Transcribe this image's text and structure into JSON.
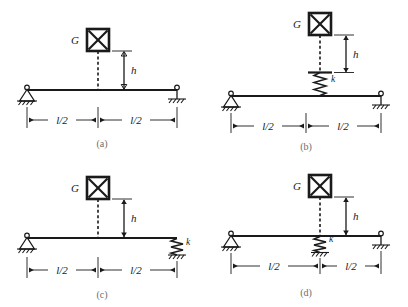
{
  "figure": {
    "background_color": "#ffffff",
    "line_color": "#1a1a1a",
    "caption_color": "#6e6e6e"
  },
  "labels": {
    "weight": "G",
    "height": "h",
    "stiffness": "k",
    "half_span": "l/2"
  },
  "panels": [
    {
      "id": "a",
      "caption": "(a)",
      "weight_label": "G",
      "height_label": "h",
      "stiffness_label": "",
      "dim_left_label": "l/2",
      "dim_right_label": "l/2",
      "left_support": "pin",
      "right_support": "roller",
      "spring_location": "none",
      "has_spring": false,
      "has_plate": false
    },
    {
      "id": "b",
      "caption": "(b)",
      "weight_label": "G",
      "height_label": "h",
      "stiffness_label": "k",
      "dim_left_label": "l/2",
      "dim_right_label": "l/2",
      "left_support": "pin",
      "right_support": "roller",
      "spring_location": "midspan-above-beam",
      "has_spring": true,
      "has_plate": true
    },
    {
      "id": "c",
      "caption": "(c)",
      "weight_label": "G",
      "height_label": "h",
      "stiffness_label": "k",
      "dim_left_label": "l/2",
      "dim_right_label": "l/2",
      "left_support": "pin",
      "right_support": "spring-to-ground",
      "spring_location": "right-support",
      "has_spring": true,
      "has_plate": false
    },
    {
      "id": "d",
      "caption": "(d)",
      "weight_label": "G",
      "height_label": "h",
      "stiffness_label": "k",
      "dim_left_label": "l/2",
      "dim_right_label": "l/2",
      "left_support": "pin",
      "right_support": "roller",
      "spring_location": "midspan-below-beam",
      "has_spring": true,
      "has_plate": false
    }
  ]
}
